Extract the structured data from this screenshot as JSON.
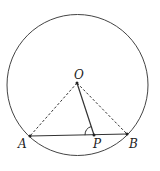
{
  "diagram": {
    "type": "geometry",
    "circle": {
      "cx": 77.5,
      "cy": 85,
      "r": 70.5
    },
    "points": {
      "O": {
        "label": "O",
        "x": 77,
        "y": 83
      },
      "A": {
        "label": "A",
        "x": 30,
        "y": 136
      },
      "P": {
        "label": "P",
        "x": 94,
        "y": 135
      },
      "B": {
        "label": "B",
        "x": 127,
        "y": 134
      }
    },
    "segments": [
      {
        "from": "A",
        "to": "B",
        "style": "solid"
      },
      {
        "from": "O",
        "to": "P",
        "style": "solid"
      },
      {
        "from": "O",
        "to": "A",
        "style": "dashed"
      },
      {
        "from": "O",
        "to": "B",
        "style": "dashed"
      }
    ],
    "angle_mark": "angle OPA",
    "colors": {
      "stroke": "#333333"
    }
  }
}
